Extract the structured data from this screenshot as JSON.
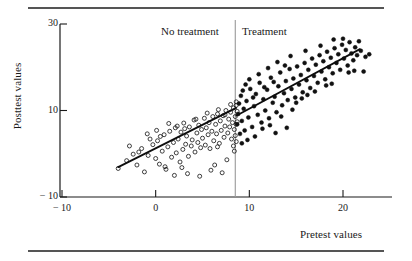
{
  "figure": {
    "rule_color": "#555555",
    "background": "#ffffff"
  },
  "chart_data": {
    "type": "scatter",
    "title": "",
    "subtitle": "",
    "xlabel": "Pretest values",
    "ylabel": "Posttest values",
    "xlim": [
      -14,
      25
    ],
    "ylim": [
      -11,
      31
    ],
    "xticks": [
      -10,
      0,
      10,
      20
    ],
    "xticklabels": [
      "− 10",
      "0",
      "10",
      "20"
    ],
    "yticks": [
      30,
      10,
      -10
    ],
    "yticklabels": [
      "30",
      "10",
      "− 10"
    ],
    "grid": false,
    "legend_position": "none",
    "annotations": [
      {
        "text": "No treatment",
        "x": 2.5,
        "y": 28.5
      },
      {
        "text": "Treatment",
        "x": 11.5,
        "y": 28.5
      }
    ],
    "vline": {
      "x": 8.5,
      "color": "#999999",
      "label": "treatment cutoff"
    },
    "series": [
      {
        "name": "No treatment",
        "marker": "open-circle",
        "color": "#111111",
        "fill": "none",
        "fit_line": {
          "x": [
            -4.0,
            8.6
          ],
          "y": [
            -3.1,
            10.6
          ]
        },
        "points": [
          [
            -4.0,
            -3.4
          ],
          [
            -3.1,
            -1.6
          ],
          [
            -2.4,
            -0.1
          ],
          [
            -2.0,
            -2.6
          ],
          [
            -1.5,
            1.2
          ],
          [
            -1.2,
            -4.2
          ],
          [
            -0.8,
            -0.4
          ],
          [
            -0.3,
            2.1
          ],
          [
            0.0,
            -1.1
          ],
          [
            0.2,
            3.0
          ],
          [
            0.4,
            -2.4
          ],
          [
            0.7,
            0.6
          ],
          [
            0.9,
            4.4
          ],
          [
            1.1,
            -3.6
          ],
          [
            1.3,
            1.6
          ],
          [
            1.5,
            5.2
          ],
          [
            1.7,
            -0.8
          ],
          [
            1.9,
            2.6
          ],
          [
            2.1,
            6.0
          ],
          [
            2.2,
            0.2
          ],
          [
            2.4,
            3.4
          ],
          [
            2.6,
            -1.9
          ],
          [
            2.7,
            5.0
          ],
          [
            2.9,
            1.0
          ],
          [
            3.0,
            7.1
          ],
          [
            3.2,
            2.2
          ],
          [
            3.3,
            4.1
          ],
          [
            3.5,
            -0.6
          ],
          [
            3.6,
            6.2
          ],
          [
            3.8,
            1.8
          ],
          [
            3.9,
            3.2
          ],
          [
            4.1,
            7.8
          ],
          [
            4.2,
            0.4
          ],
          [
            4.4,
            4.8
          ],
          [
            4.5,
            2.6
          ],
          [
            4.6,
            6.6
          ],
          [
            4.8,
            1.4
          ],
          [
            4.9,
            5.6
          ],
          [
            5.0,
            3.6
          ],
          [
            5.2,
            8.2
          ],
          [
            5.3,
            2.0
          ],
          [
            5.4,
            6.0
          ],
          [
            5.6,
            4.4
          ],
          [
            5.7,
            7.2
          ],
          [
            5.8,
            1.2
          ],
          [
            6.0,
            5.2
          ],
          [
            6.1,
            8.6
          ],
          [
            6.2,
            3.0
          ],
          [
            6.4,
            6.8
          ],
          [
            6.5,
            4.6
          ],
          [
            6.6,
            9.2
          ],
          [
            6.8,
            2.4
          ],
          [
            6.9,
            7.6
          ],
          [
            7.0,
            5.4
          ],
          [
            7.2,
            8.8
          ],
          [
            7.3,
            3.8
          ],
          [
            7.4,
            6.4
          ],
          [
            7.5,
            10.0
          ],
          [
            7.7,
            4.8
          ],
          [
            7.8,
            8.0
          ],
          [
            7.9,
            6.2
          ],
          [
            8.0,
            9.6
          ],
          [
            8.1,
            3.4
          ],
          [
            8.2,
            7.2
          ],
          [
            8.3,
            10.6
          ],
          [
            8.4,
            5.6
          ],
          [
            8.5,
            8.6
          ],
          [
            8.6,
            11.2
          ],
          [
            8.6,
            6.8
          ],
          [
            8.7,
            9.8
          ],
          [
            2.0,
            -5.0
          ],
          [
            3.4,
            -4.6
          ],
          [
            4.7,
            -5.2
          ],
          [
            5.9,
            -3.8
          ],
          [
            7.1,
            -4.4
          ],
          [
            1.0,
            -3.0
          ],
          [
            6.3,
            -2.6
          ],
          [
            7.6,
            -1.4
          ],
          [
            8.4,
            0.6
          ],
          [
            8.6,
            2.8
          ],
          [
            8.5,
            4.2
          ],
          [
            8.7,
            7.4
          ],
          [
            8.3,
            1.8
          ],
          [
            8.6,
            12.0
          ],
          [
            8.0,
            11.4
          ],
          [
            7.4,
            9.0
          ],
          [
            6.7,
            10.2
          ],
          [
            5.5,
            9.4
          ],
          [
            4.3,
            8.0
          ],
          [
            3.1,
            5.8
          ],
          [
            2.8,
            -3.2
          ],
          [
            0.5,
            4.0
          ],
          [
            -0.6,
            3.4
          ],
          [
            -1.8,
            0.4
          ],
          [
            -2.8,
            1.8
          ],
          [
            1.4,
            7.0
          ],
          [
            2.3,
            6.4
          ],
          [
            0.1,
            5.4
          ],
          [
            -0.9,
            4.6
          ],
          [
            6.6,
            1.6
          ]
        ]
      },
      {
        "name": "Treatment",
        "marker": "filled-circle",
        "color": "#111111",
        "fill": "#111111",
        "fit_line": {
          "x": [
            8.6,
            21.8
          ],
          "y": [
            8.8,
            24.2
          ]
        },
        "points": [
          [
            8.7,
            6.8
          ],
          [
            8.8,
            9.2
          ],
          [
            8.9,
            11.6
          ],
          [
            9.0,
            4.6
          ],
          [
            9.1,
            13.4
          ],
          [
            9.2,
            7.6
          ],
          [
            9.4,
            10.4
          ],
          [
            9.5,
            5.4
          ],
          [
            9.7,
            12.2
          ],
          [
            9.9,
            8.4
          ],
          [
            10.1,
            15.0
          ],
          [
            10.3,
            6.2
          ],
          [
            10.5,
            11.0
          ],
          [
            10.7,
            13.8
          ],
          [
            10.9,
            9.0
          ],
          [
            11.1,
            16.4
          ],
          [
            11.3,
            7.2
          ],
          [
            11.5,
            12.6
          ],
          [
            11.7,
            10.0
          ],
          [
            11.9,
            14.8
          ],
          [
            12.1,
            8.2
          ],
          [
            12.3,
            17.6
          ],
          [
            12.5,
            11.8
          ],
          [
            12.7,
            13.2
          ],
          [
            12.9,
            9.6
          ],
          [
            13.1,
            15.6
          ],
          [
            13.3,
            18.8
          ],
          [
            13.5,
            11.2
          ],
          [
            13.7,
            14.0
          ],
          [
            13.9,
            16.8
          ],
          [
            14.1,
            12.4
          ],
          [
            14.3,
            19.6
          ],
          [
            14.5,
            15.0
          ],
          [
            14.7,
            17.4
          ],
          [
            14.9,
            13.0
          ],
          [
            15.1,
            20.2
          ],
          [
            15.3,
            16.0
          ],
          [
            15.5,
            18.2
          ],
          [
            15.7,
            14.2
          ],
          [
            15.9,
            21.0
          ],
          [
            16.1,
            17.0
          ],
          [
            16.3,
            19.4
          ],
          [
            16.5,
            15.2
          ],
          [
            16.7,
            22.0
          ],
          [
            16.9,
            18.0
          ],
          [
            17.1,
            20.6
          ],
          [
            17.3,
            16.4
          ],
          [
            17.5,
            22.8
          ],
          [
            17.7,
            19.0
          ],
          [
            17.9,
            21.4
          ],
          [
            18.1,
            17.2
          ],
          [
            18.3,
            23.6
          ],
          [
            18.5,
            20.0
          ],
          [
            18.7,
            22.2
          ],
          [
            18.9,
            18.6
          ],
          [
            19.1,
            24.4
          ],
          [
            19.3,
            21.0
          ],
          [
            19.5,
            23.0
          ],
          [
            19.7,
            19.4
          ],
          [
            19.9,
            25.2
          ],
          [
            20.1,
            22.0
          ],
          [
            20.3,
            24.0
          ],
          [
            20.5,
            20.4
          ],
          [
            20.7,
            25.8
          ],
          [
            20.9,
            23.2
          ],
          [
            21.1,
            21.6
          ],
          [
            21.3,
            24.6
          ],
          [
            21.5,
            22.8
          ],
          [
            21.7,
            26.0
          ],
          [
            21.9,
            23.8
          ],
          [
            22.4,
            22.4
          ],
          [
            22.8,
            23.0
          ],
          [
            19.0,
            26.4
          ],
          [
            20.0,
            26.6
          ],
          [
            17.6,
            25.0
          ],
          [
            16.0,
            23.8
          ],
          [
            14.4,
            22.6
          ],
          [
            13.0,
            21.2
          ],
          [
            12.0,
            19.8
          ],
          [
            11.0,
            18.4
          ],
          [
            10.0,
            17.2
          ],
          [
            9.3,
            14.6
          ],
          [
            9.6,
            16.0
          ],
          [
            12.6,
            16.6
          ],
          [
            13.8,
            20.4
          ],
          [
            15.0,
            11.8
          ],
          [
            16.2,
            13.6
          ],
          [
            11.4,
            5.8
          ],
          [
            10.6,
            4.0
          ],
          [
            9.8,
            3.2
          ],
          [
            12.2,
            6.6
          ],
          [
            13.4,
            8.6
          ],
          [
            14.6,
            10.2
          ],
          [
            15.6,
            12.8
          ],
          [
            17.0,
            14.4
          ],
          [
            18.2,
            15.8
          ],
          [
            14.0,
            6.0
          ],
          [
            12.8,
            4.8
          ],
          [
            11.6,
            15.4
          ],
          [
            10.4,
            13.0
          ],
          [
            9.2,
            2.4
          ],
          [
            18.8,
            16.2
          ],
          [
            20.6,
            18.8
          ],
          [
            21.2,
            19.2
          ],
          [
            22.2,
            19.0
          ]
        ]
      }
    ]
  },
  "axes": {
    "x_title": "Pretest values",
    "y_title": "Posttest values"
  }
}
